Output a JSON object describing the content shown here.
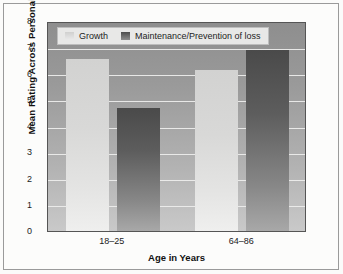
{
  "chart_data": {
    "type": "bar",
    "title": "",
    "subtitle": "",
    "xlabel": "Age in Years",
    "ylabel": "Mean Rating Across Personal Goals",
    "categories": [
      "18–25",
      "64–86"
    ],
    "series": [
      {
        "name": "Growth",
        "values": [
          6.55,
          6.15
        ],
        "color": "#d8d8d7"
      },
      {
        "name": "Maintenance/Prevention of loss",
        "values": [
          4.7,
          6.9
        ],
        "color": "#5d5d5d"
      }
    ],
    "ylim": [
      0,
      8
    ],
    "yticks": [
      "0",
      "1",
      "2",
      "3",
      "4",
      "5",
      "6",
      "7",
      "8"
    ],
    "grid": true,
    "legend_position": "top-inside-left",
    "plot_background": "#9a9a9a",
    "figure_background": "#fcfcfb"
  },
  "axis": {
    "y_tick_labels": [
      "8",
      "7",
      "6",
      "5",
      "4",
      "3",
      "2",
      "1",
      "0"
    ],
    "y_title": "Mean Rating Across Personal Goals",
    "x_title": "Age in Years",
    "x_tick_labels": [
      "18–25",
      "64–86"
    ]
  },
  "legend": {
    "entries": [
      {
        "label": "Growth",
        "swatch": "growth-swatch"
      },
      {
        "label": "Maintenance/Prevention of loss",
        "swatch": "maintenance-swatch"
      }
    ]
  }
}
